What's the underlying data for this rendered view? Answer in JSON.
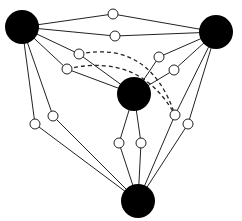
{
  "diagram": {
    "type": "graph",
    "width": 242,
    "height": 221,
    "colors": {
      "background": "#ffffff",
      "stroke": "#222222",
      "major_fill": "#000000",
      "minor_fill": "#ffffff"
    },
    "major_nodes": [
      {
        "id": "A",
        "x": 22,
        "y": 27,
        "r": 17
      },
      {
        "id": "B",
        "x": 216,
        "y": 32,
        "r": 17
      },
      {
        "id": "C",
        "x": 134,
        "y": 94,
        "r": 17
      },
      {
        "id": "D",
        "x": 138,
        "y": 201,
        "r": 17
      }
    ],
    "minor_nodes": [
      {
        "id": "ab1",
        "x": 113,
        "y": 14
      },
      {
        "id": "ab2",
        "x": 115,
        "y": 36
      },
      {
        "id": "ac1",
        "x": 79,
        "y": 54
      },
      {
        "id": "ac2",
        "x": 67,
        "y": 69
      },
      {
        "id": "bc1",
        "x": 159,
        "y": 57
      },
      {
        "id": "bc2",
        "x": 174,
        "y": 70
      },
      {
        "id": "ad1",
        "x": 35,
        "y": 124
      },
      {
        "id": "ad2",
        "x": 53,
        "y": 116
      },
      {
        "id": "cd1",
        "x": 119,
        "y": 143
      },
      {
        "id": "cd2",
        "x": 141,
        "y": 143
      },
      {
        "id": "bd1",
        "x": 175,
        "y": 115
      },
      {
        "id": "bd2",
        "x": 188,
        "y": 124
      }
    ],
    "edges": [
      [
        "A",
        "ab1"
      ],
      [
        "ab1",
        "B"
      ],
      [
        "A",
        "ab2"
      ],
      [
        "ab2",
        "B"
      ],
      [
        "A",
        "ac1"
      ],
      [
        "ac1",
        "C"
      ],
      [
        "A",
        "ac2"
      ],
      [
        "ac2",
        "C"
      ],
      [
        "B",
        "bc1"
      ],
      [
        "bc1",
        "C"
      ],
      [
        "B",
        "bc2"
      ],
      [
        "bc2",
        "C"
      ],
      [
        "A",
        "ad1"
      ],
      [
        "ad1",
        "D"
      ],
      [
        "A",
        "ad2"
      ],
      [
        "ad2",
        "D"
      ],
      [
        "C",
        "cd1"
      ],
      [
        "cd1",
        "D"
      ],
      [
        "C",
        "cd2"
      ],
      [
        "cd2",
        "D"
      ],
      [
        "B",
        "bd1"
      ],
      [
        "bd1",
        "D"
      ],
      [
        "B",
        "bd2"
      ],
      [
        "bd2",
        "D"
      ]
    ],
    "dashed_edges": [
      {
        "from": "ac1",
        "to": "bd1",
        "cx": 150,
        "cy": 40
      },
      {
        "from": "ac2",
        "to": "bd1",
        "cx": 140,
        "cy": 52
      }
    ],
    "minor_r": 5
  }
}
